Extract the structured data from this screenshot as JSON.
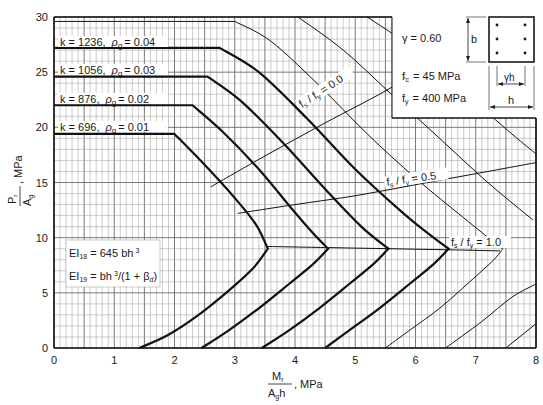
{
  "chart_data": {
    "type": "line",
    "title": "",
    "xlabel": "Mr / (Ag h), MPa",
    "ylabel": "Pr / Ag, MPa",
    "xlim": [
      0,
      8
    ],
    "ylim": [
      0,
      30
    ],
    "grid": true,
    "x_ticks": [
      0,
      1,
      2,
      3,
      4,
      5,
      6,
      7,
      8
    ],
    "y_ticks": [
      0,
      5,
      10,
      15,
      20,
      25,
      30
    ],
    "series": [
      {
        "name": "k = 696, ρg = 0.01",
        "k": 696,
        "rho_g": 0.01,
        "bold": true,
        "points": [
          [
            0,
            19.4
          ],
          [
            2.0,
            19.4
          ],
          [
            2.5,
            16.6
          ],
          [
            3.0,
            13.6
          ],
          [
            3.35,
            11.2
          ],
          [
            3.55,
            9.0
          ],
          [
            3.3,
            7.2
          ],
          [
            2.9,
            5.2
          ],
          [
            2.4,
            3.0
          ],
          [
            1.9,
            1.2
          ],
          [
            1.42,
            0
          ]
        ]
      },
      {
        "name": "k = 876, ρg = 0.02",
        "k": 876,
        "rho_g": 0.02,
        "bold": true,
        "points": [
          [
            0,
            22.0
          ],
          [
            2.3,
            22.0
          ],
          [
            2.8,
            19.6
          ],
          [
            3.4,
            16.2
          ],
          [
            3.95,
            12.6
          ],
          [
            4.3,
            10.4
          ],
          [
            4.55,
            9.0
          ],
          [
            4.3,
            7.6
          ],
          [
            3.9,
            5.8
          ],
          [
            3.4,
            3.6
          ],
          [
            2.9,
            1.6
          ],
          [
            2.45,
            0
          ]
        ]
      },
      {
        "name": "k = 1056, ρg = 0.03",
        "k": 1056,
        "rho_g": 0.03,
        "bold": true,
        "points": [
          [
            0,
            24.6
          ],
          [
            2.55,
            24.6
          ],
          [
            3.1,
            22.4
          ],
          [
            3.8,
            18.6
          ],
          [
            4.5,
            14.4
          ],
          [
            5.1,
            11.0
          ],
          [
            5.55,
            9.0
          ],
          [
            5.3,
            7.6
          ],
          [
            4.9,
            5.8
          ],
          [
            4.4,
            3.6
          ],
          [
            3.9,
            1.6
          ],
          [
            3.45,
            0
          ]
        ]
      },
      {
        "name": "k = 1236, ρg = 0.04",
        "k": 1236,
        "rho_g": 0.04,
        "bold": true,
        "points": [
          [
            0,
            27.2
          ],
          [
            2.75,
            27.2
          ],
          [
            3.4,
            25.0
          ],
          [
            4.2,
            20.8
          ],
          [
            5.0,
            16.2
          ],
          [
            5.8,
            12.2
          ],
          [
            6.3,
            10.0
          ],
          [
            6.55,
            9.0
          ],
          [
            6.3,
            7.6
          ],
          [
            5.9,
            5.8
          ],
          [
            5.4,
            3.6
          ],
          [
            4.9,
            1.6
          ],
          [
            4.5,
            0
          ]
        ]
      },
      {
        "name": "thin curve 1",
        "bold": false,
        "points": [
          [
            0,
            29.6
          ],
          [
            3.0,
            29.6
          ],
          [
            3.6,
            27.8
          ],
          [
            4.4,
            23.8
          ],
          [
            5.2,
            19.4
          ],
          [
            6.0,
            15.4
          ],
          [
            6.8,
            11.8
          ],
          [
            7.3,
            9.6
          ],
          [
            7.45,
            9.0
          ],
          [
            7.3,
            8.0
          ],
          [
            6.9,
            6.0
          ],
          [
            6.4,
            3.6
          ],
          [
            5.9,
            1.6
          ],
          [
            5.5,
            0
          ]
        ]
      },
      {
        "name": "thin curve 2",
        "bold": false,
        "points": [
          [
            4.05,
            30
          ],
          [
            4.8,
            27.0
          ],
          [
            5.6,
            23.0
          ],
          [
            6.4,
            19.0
          ],
          [
            7.2,
            15.0
          ],
          [
            7.95,
            11.6
          ]
        ]
      },
      {
        "name": "thin curve 3",
        "bold": false,
        "points": [
          [
            5.2,
            30
          ],
          [
            6.0,
            27.0
          ],
          [
            6.8,
            23.2
          ],
          [
            7.6,
            19.4
          ],
          [
            8.0,
            17.6
          ]
        ]
      },
      {
        "name": "thin curve 4",
        "bold": false,
        "points": [
          [
            6.55,
            30
          ],
          [
            7.3,
            27.4
          ],
          [
            8.0,
            24.6
          ]
        ]
      },
      {
        "name": "thin tail a",
        "bold": false,
        "points": [
          [
            6.5,
            0
          ],
          [
            7.1,
            2.4
          ],
          [
            7.6,
            4.6
          ],
          [
            8.0,
            5.8
          ]
        ]
      },
      {
        "name": "thin tail b",
        "bold": false,
        "points": [
          [
            7.5,
            0
          ],
          [
            8.0,
            2.2
          ]
        ]
      },
      {
        "name": "fs/fy = 0.0",
        "bold": false,
        "points": [
          [
            2.6,
            14.6
          ],
          [
            3.5,
            17.4
          ],
          [
            4.5,
            20.4
          ],
          [
            5.5,
            23.3
          ],
          [
            6.3,
            26.0
          ]
        ]
      },
      {
        "name": "fs/fy = 0.5",
        "bold": false,
        "points": [
          [
            3.05,
            12.2
          ],
          [
            4.0,
            13.0
          ],
          [
            5.0,
            13.8
          ],
          [
            6.0,
            14.8
          ],
          [
            7.0,
            15.8
          ],
          [
            8.0,
            16.8
          ]
        ]
      },
      {
        "name": "fs/fy = 1.0",
        "bold": false,
        "points": [
          [
            3.55,
            9.2
          ],
          [
            4.55,
            9.1
          ],
          [
            5.55,
            9.0
          ],
          [
            6.55,
            8.9
          ],
          [
            7.4,
            8.8
          ]
        ]
      }
    ],
    "annotations": [
      "k = 1236, ρg = 0.04",
      "k = 1056, ρg = 0.03",
      "k = 876, ρg = 0.02",
      "k = 696, ρg = 0.01",
      "fs / fy = 0.0",
      "fs / fy = 0.5",
      "fs / fy = 1.0",
      "γ = 0.60",
      "f'c = 45 MPa",
      "fy = 400 MPa",
      "EI18 = 645 bh³",
      "EI19 = bh³/(1 + βd)"
    ]
  },
  "labels": {
    "k_labels": [
      {
        "k": "k = 1236,",
        "rho": "ρ",
        "sub": "g",
        "val": "= 0.04"
      },
      {
        "k": "k = 1056,",
        "rho": "ρ",
        "sub": "g",
        "val": "= 0.03"
      },
      {
        "k": "k =  876,",
        "rho": "ρ",
        "sub": "g",
        "val": "= 0.02"
      },
      {
        "k": "k =  696,",
        "rho": "ρ",
        "sub": "g",
        "val": "= 0.01"
      }
    ],
    "gamma": "γ  =  0.60",
    "fc_main": "f",
    "fc_sub": "c",
    "fc_val": "=   45  MPa",
    "fy_main": "f",
    "fy_sub": "y",
    "fy_val": "=  400  MPa",
    "section_b": "b",
    "section_gh": "γh",
    "section_h": "h",
    "ei18_main": "EI",
    "ei18_sub": "18",
    "ei18_val": " = 645 bh",
    "ei18_sup": "3",
    "ei19_main": "EI",
    "ei19_sub": "19",
    "ei19_val": " = bh",
    "ei19_sup": "3",
    "ei19_tail": "/(1 + β",
    "ei19_tail_sub": "d",
    "ei19_close": ")",
    "fs0": {
      "f": "f",
      "s": "s",
      "slash": " / f",
      "y": "y",
      "val": " = 0.0"
    },
    "fs05": {
      "f": "f",
      "s": "s",
      "slash": " / f",
      "y": "y",
      "val": " = 0.5"
    },
    "fs10": {
      "f": "f",
      "s": "s",
      "slash": " / f",
      "y": "y",
      "val": " = 1.0"
    },
    "x_axis": {
      "num_main": "M",
      "num_sub": "r",
      "den_main": "A",
      "den_sub": "g",
      "den_tail": "h",
      "unit": ", MPa"
    },
    "y_axis": {
      "num_main": "P",
      "num_sub": "r",
      "den_main": "A",
      "den_sub": "g",
      "unit": ", MPa"
    }
  }
}
